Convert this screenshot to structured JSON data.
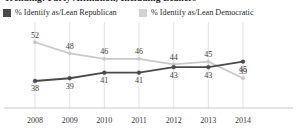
{
  "title": "Trending: Party Affiliation, Including Leaners",
  "legend": {
    "position": "top-left",
    "items": [
      {
        "label": "% Identify as/Lean Republican",
        "color": "#4a4a4a",
        "swatch": "legend-swatch-republican"
      },
      {
        "label": "% Identify as/Lean Democratic",
        "color": "#d2d2d2",
        "swatch": "legend-swatch-democratic"
      }
    ]
  },
  "chart_data": {
    "type": "line",
    "title": "Trending: Party Affiliation, Including Leaners",
    "xlabel": "",
    "ylabel": "",
    "categories": [
      "2008",
      "2009",
      "2010",
      "2011",
      "2012",
      "2013",
      "2014"
    ],
    "ylim": [
      34,
      55
    ],
    "grid": "vertical",
    "legend_position": "top-left",
    "data_labels": true,
    "series": [
      {
        "name": "% Identify as/Lean Republican",
        "color": "#4a4a4a",
        "values": [
          38,
          39,
          41,
          41,
          43,
          43,
          45
        ]
      },
      {
        "name": "% Identify as/Lean Democratic",
        "color": "#c9c9c9",
        "values": [
          52,
          48,
          46,
          46,
          44,
          45,
          39
        ]
      }
    ]
  }
}
